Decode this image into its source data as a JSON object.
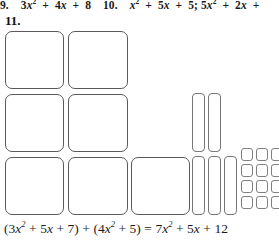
{
  "worksheet": {
    "previous_problems": {
      "item9_number": "9.",
      "item9_expr_plain": "3x2 + 4x + 8",
      "item10_number": "10.",
      "item10_expr_plain": "x2 + 5x + 5; 5x2 + 2x +"
    },
    "problem": {
      "number": "11.",
      "equation_plain": "(3x^2 + 5x + 7) + (4x^2 + 5) = 7x^2 + 5x + 12",
      "equation_parts": {
        "open1": "(",
        "coef_a1": "3",
        "var_a1": "x",
        "exp_a1": "2",
        "plus1": "+",
        "coef_b1": "5",
        "var_b1": "x",
        "plus2": "+",
        "const1": "7",
        "close1": ")",
        "plus3": "+",
        "open2": "(",
        "coef_a2": "4",
        "var_a2": "x",
        "exp_a2": "2",
        "plus4": "+",
        "const2": "5",
        "close2": ")",
        "equals": "=",
        "coef_r": "7",
        "var_r": "x",
        "exp_r": "2",
        "plus5": "+",
        "coef_rb": "5",
        "var_rb": "x",
        "plus6": "+",
        "const_r": "12"
      }
    },
    "tile_model": {
      "x_squared_tiles_count": 7,
      "x_strip_tiles_count": 5,
      "unit_tiles_count": 12,
      "legend": {
        "x_squared": "x^2 tile (large square)",
        "x_strip": "x tile (tall rectangle)",
        "unit": "1 tile (small square)"
      },
      "colors": {
        "tile_fill": "#ffffff",
        "tile_outline": "#6e6e72",
        "page_background": "#ffffff",
        "text": "#1b1b1b"
      }
    }
  }
}
